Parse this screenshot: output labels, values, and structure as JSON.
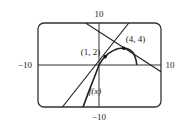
{
  "chart_data": {
    "type": "line",
    "title": "",
    "xlabel": "",
    "ylabel": "",
    "xlim": [
      -10,
      10
    ],
    "ylim": [
      -10,
      10
    ],
    "grid": false,
    "tick_labels": {
      "x_min": "−10",
      "x_max": "10",
      "y_min": "−10",
      "y_max": "10"
    },
    "series": [
      {
        "name": "f(x)",
        "kind": "curve",
        "points": [
          [
            -2.6,
            -10
          ],
          [
            -2.0,
            -7.6
          ],
          [
            -1.5,
            -5.7
          ],
          [
            -1.0,
            -3.8
          ],
          [
            -0.5,
            -1.9
          ],
          [
            0,
            0
          ],
          [
            0.5,
            1.2
          ],
          [
            1,
            2
          ],
          [
            1.5,
            2.7
          ],
          [
            2,
            3.2
          ],
          [
            2.5,
            3.6
          ],
          [
            3,
            3.85
          ],
          [
            3.5,
            3.97
          ],
          [
            4,
            4
          ],
          [
            4.5,
            3.9
          ],
          [
            5,
            3.6
          ],
          [
            5.5,
            2.9
          ],
          [
            5.8,
            2.0
          ],
          [
            6,
            1.0
          ],
          [
            6.1,
            0
          ]
        ]
      },
      {
        "name": "tangent line at (1, 2)",
        "kind": "line",
        "points": [
          [
            -6.0,
            -10
          ],
          [
            4.8,
            10
          ]
        ]
      },
      {
        "name": "tangent line at (4, 4)",
        "kind": "line",
        "points": [
          [
            -2.2,
            10
          ],
          [
            10,
            -1.6
          ]
        ]
      }
    ],
    "annotations": [
      {
        "text": "(1, 2)",
        "x": 1,
        "y": 2,
        "marker": true
      },
      {
        "text": "(4, 4)",
        "x": 4,
        "y": 4,
        "marker": true
      },
      {
        "text": "f(x)",
        "x": -2.0,
        "y": -6.5,
        "marker": false
      }
    ]
  }
}
